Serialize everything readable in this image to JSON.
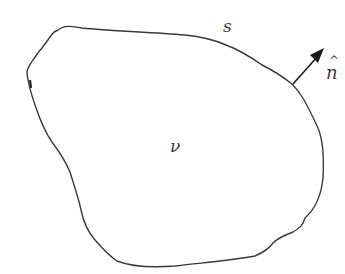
{
  "diagram": {
    "type": "control-volume-sketch",
    "labels": {
      "surface": "s",
      "normal": "n",
      "normal_hat": "^",
      "volume": "ν"
    },
    "colors": {
      "stroke": "#3a3a3a",
      "arrow": "#1a1a1a",
      "background": "#ffffff"
    },
    "elements": [
      {
        "id": "boundary",
        "kind": "closed-curve",
        "description": "irregular closed region boundary (surface s)"
      },
      {
        "id": "normal-arrow",
        "kind": "arrow",
        "description": "outward unit normal vector n-hat at upper-right of boundary"
      },
      {
        "id": "volume-label",
        "kind": "text",
        "description": "volume ν inside region"
      }
    ]
  }
}
